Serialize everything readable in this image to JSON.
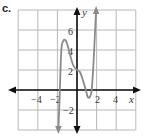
{
  "figure_label": "c.",
  "colors": {
    "grid": "#b8b8b8",
    "axes": "#111111",
    "curve": "#8a8a8a",
    "text": "#333333"
  },
  "axes": {
    "x_label": "x",
    "y_label": "y",
    "x_ticks": [
      "−4",
      "−2",
      "2",
      "4"
    ],
    "y_ticks": [
      "6",
      "4",
      "2",
      "−2"
    ]
  },
  "chart_data": {
    "type": "line",
    "title": "c.",
    "xlabel": "x",
    "ylabel": "y",
    "xlim": [
      -6,
      6
    ],
    "ylim": [
      -4,
      8
    ],
    "grid": true,
    "grid_step": 2,
    "x_tick_labels": [
      -4,
      -2,
      2,
      4
    ],
    "y_tick_labels": [
      6,
      4,
      2,
      -2
    ],
    "series": [
      {
        "name": "f(x)",
        "points": [
          [
            -1.9,
            -4
          ],
          [
            -1.75,
            0
          ],
          [
            -1.6,
            4
          ],
          [
            -1.4,
            4.9
          ],
          [
            -1.2,
            5
          ],
          [
            -1.0,
            4.6
          ],
          [
            -0.7,
            3.5
          ],
          [
            -0.4,
            2.5
          ],
          [
            0,
            2
          ],
          [
            0.3,
            1.8
          ],
          [
            0.6,
            1
          ],
          [
            0.9,
            0
          ],
          [
            1.1,
            -0.7
          ],
          [
            1.3,
            -0.7
          ],
          [
            1.5,
            0
          ],
          [
            1.7,
            3
          ],
          [
            1.85,
            6
          ],
          [
            1.95,
            8
          ]
        ],
        "end_arrows": [
          "down-left-end",
          "up-right-end"
        ]
      }
    ],
    "annotations": [
      "local max ≈ (-1.2, 5)",
      "y-intercept (0, 2)",
      "local min ≈ (1.2, -0.7)"
    ]
  }
}
